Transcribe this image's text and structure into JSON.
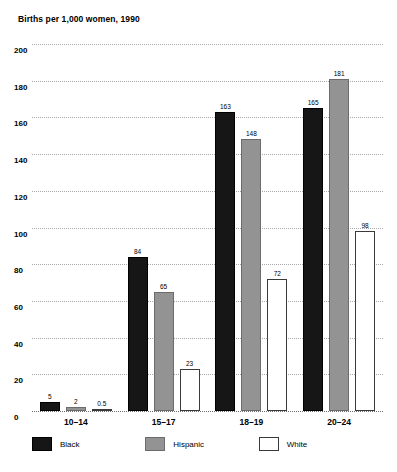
{
  "chart_data": {
    "type": "bar",
    "title": "Births per 1,000 women, 1990",
    "subtitle": "",
    "xlabel": "",
    "ylabel": "",
    "categories": [
      "10–14",
      "15–17",
      "18–19",
      "20–24"
    ],
    "series": [
      {
        "name": "Black",
        "color": "#161616",
        "values": [
          5,
          84,
          163,
          165
        ],
        "labels": [
          "5",
          "84",
          "163",
          "165"
        ]
      },
      {
        "name": "Hispanic",
        "color": "#939393",
        "values": [
          2,
          65,
          148,
          181
        ],
        "labels": [
          "2",
          "65",
          "148",
          "181"
        ]
      },
      {
        "name": "White",
        "color": "#ffffff",
        "values": [
          0.5,
          23,
          72,
          98
        ],
        "labels": [
          "0.5",
          "23",
          "72",
          "98"
        ]
      }
    ],
    "ylim": [
      0,
      200
    ],
    "ytick_step": 20,
    "yticks": [
      "0",
      "20",
      "40",
      "60",
      "80",
      "100",
      "120",
      "140",
      "160",
      "180",
      "200"
    ],
    "grid": true,
    "legend_position": "bottom",
    "legend": [
      "Black",
      "Hispanic",
      "White"
    ]
  }
}
